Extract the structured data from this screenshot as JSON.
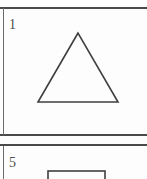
{
  "document": {
    "type": "shape-worksheet-scan",
    "background_color": "#fdfdfd",
    "rule_color": "#4a4a4a",
    "shape_stroke_color": "#3f3f3f"
  },
  "panels": [
    {
      "number": "1",
      "shape_name": "triangle",
      "shape_style": "outline",
      "vertices": "78,33 38,102 118,102"
    },
    {
      "number": "5",
      "shape_name": "rectangle",
      "shape_style": "outline",
      "rect": {
        "x": 48,
        "y": 25,
        "width": 57,
        "height": 18
      }
    }
  ],
  "rules": {
    "top_label": "top-divider",
    "middle_a_label": "panel-separator-upper",
    "middle_b_label": "panel-separator-lower"
  }
}
